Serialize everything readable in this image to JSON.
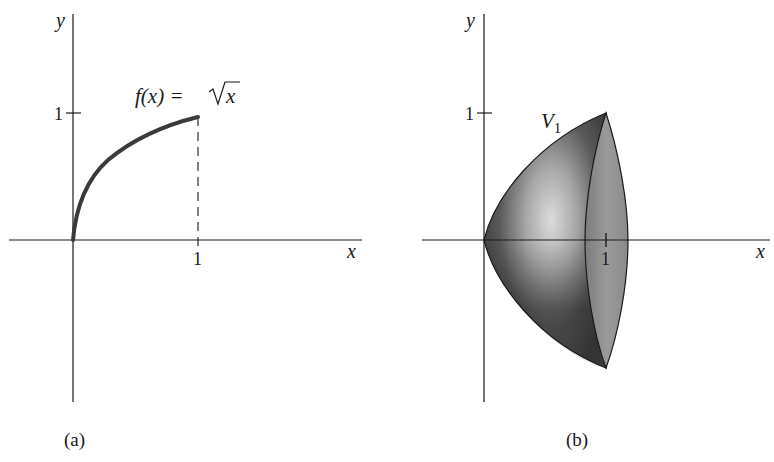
{
  "panel_a": {
    "caption": "(a)",
    "x_axis_label": "x",
    "y_axis_label": "y",
    "x_tick_label": "1",
    "y_tick_label": "1",
    "function_label_left": "f(x) = ",
    "function_label_sqrt": "x"
  },
  "panel_b": {
    "caption": "(b)",
    "x_axis_label": "x",
    "y_axis_label": "y",
    "x_tick_label": "1",
    "y_tick_label": "1",
    "solid_label": "V",
    "solid_label_subscript": "1"
  },
  "colors": {
    "ink": "#1a1a1a",
    "curve": "#3a3a3a",
    "solid_dark": "#2e2e2e",
    "solid_light": "#d8d8d8",
    "disc_face": "#8a8a8a"
  }
}
